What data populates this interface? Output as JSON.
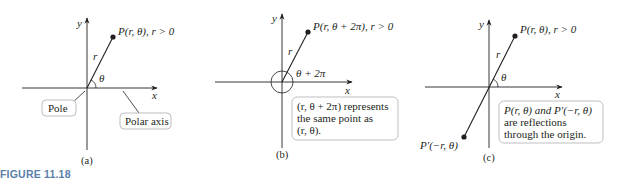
{
  "figure": {
    "title": "FIGURE 11.18",
    "title_color": "#5a7fa8",
    "axis_color": "#231f20"
  },
  "panels": [
    {
      "id": "a",
      "caption": "(a)",
      "axis_x_label": "x",
      "axis_y_label": "y",
      "radius_label": "r",
      "angle_label": "θ",
      "point_label": "P(r, θ), r > 0",
      "pole_label": "Pole",
      "polar_axis_label": "Polar axis"
    },
    {
      "id": "b",
      "caption": "(b)",
      "axis_x_label": "x",
      "axis_y_label": "y",
      "radius_label": "r",
      "angle_label": "θ + 2π",
      "point_label": "P(r, θ + 2π), r > 0",
      "note_lines": [
        "(r, θ + 2π) represents",
        "the same point as",
        "(r, θ)."
      ]
    },
    {
      "id": "c",
      "caption": "(c)",
      "axis_x_label": "x",
      "axis_y_label": "y",
      "radius_label": "r",
      "angle_label": "θ",
      "point_label": "P(r, θ), r > 0",
      "reflected_point_label": "P′(−r, θ)",
      "note_lines": [
        "P(r, θ) and P′(−r, θ)",
        "are reflections",
        "through the origin."
      ]
    }
  ]
}
